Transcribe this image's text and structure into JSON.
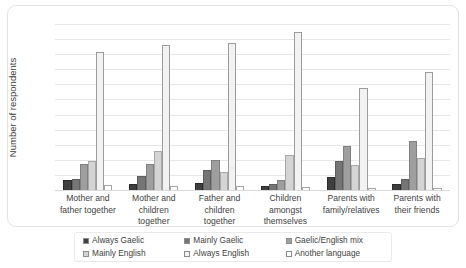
{
  "chart_data": {
    "type": "bar",
    "title": "",
    "xlabel": "",
    "ylabel": "Number of respondents",
    "ylim": [
      0,
      220
    ],
    "ytick_step": 20,
    "yticks": [
      220,
      200,
      180,
      160,
      140,
      120,
      100,
      80,
      60,
      40,
      20,
      0
    ],
    "grid": true,
    "legend_position": "bottom",
    "categories": [
      "Mother and father together",
      "Mother and children together",
      "Father and children together",
      "Children amongst themselves",
      "Parents with family/relatives",
      "Parents with their friends"
    ],
    "series": [
      {
        "name": "Always Gaelic",
        "color": "#3f3f3f",
        "values": [
          13,
          8,
          9,
          5,
          17,
          8
        ]
      },
      {
        "name": "Mainly Gaelic",
        "color": "#757575",
        "values": [
          14,
          18,
          27,
          8,
          38,
          15
        ]
      },
      {
        "name": "Gaelic/English mix",
        "color": "#9e9e9e",
        "values": [
          34,
          35,
          40,
          13,
          58,
          65
        ]
      },
      {
        "name": "Mainly English",
        "color": "#d4d4d4",
        "values": [
          38,
          52,
          24,
          47,
          33,
          43
        ]
      },
      {
        "name": "Always English",
        "color": "#f2f2f2",
        "values": [
          183,
          192,
          195,
          210,
          135,
          157
        ]
      },
      {
        "name": "Another language",
        "color": "#ffffff",
        "values": [
          6,
          5,
          5,
          4,
          3,
          3
        ]
      }
    ]
  }
}
